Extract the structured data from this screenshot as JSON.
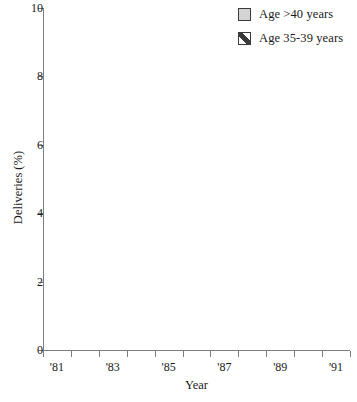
{
  "chart_data": {
    "type": "bar",
    "stacked": true,
    "title": "",
    "xlabel": "Year",
    "ylabel": "Deliveries (%)",
    "ylim": [
      0,
      10
    ],
    "ytick_values": [
      0,
      2,
      4,
      6,
      8,
      10
    ],
    "ytick_labels": [
      "0",
      "2",
      "4",
      "6",
      "8",
      "10"
    ],
    "grid": false,
    "legend_position": "top-right",
    "categories": [
      "'81",
      "'82",
      "'83",
      "'84",
      "'85",
      "'86",
      "'87",
      "'88",
      "'89",
      "'90",
      "'91"
    ],
    "xtick_labels": [
      "'81",
      "",
      "'83",
      "",
      "'85",
      "",
      "'87",
      "",
      "'89",
      "",
      "'91"
    ],
    "series": [
      {
        "name": "Age 35-39 years",
        "fill": "diagonal-hatch",
        "values": [
          4.4,
          5.1,
          5.4,
          5.4,
          5.5,
          5.5,
          5.4,
          5.5,
          5.9,
          6.4,
          6.4
        ]
      },
      {
        "name": "Age >40 years",
        "fill": "solid-gray",
        "values": [
          0.8,
          0.65,
          0.75,
          0.7,
          0.75,
          0.9,
          0.75,
          0.85,
          0.9,
          1.0,
          1.0
        ]
      }
    ],
    "totals": [
      5.2,
      5.75,
      6.15,
      6.1,
      6.25,
      6.4,
      6.15,
      6.35,
      6.8,
      7.4,
      7.4
    ]
  },
  "legend": {
    "items": [
      {
        "label": "Age >40 years",
        "swatch": "solid-gray"
      },
      {
        "label": "Age 35-39 years",
        "swatch": "diagonal-hatch"
      }
    ]
  },
  "axes": {
    "y_title": "Deliveries (%)",
    "x_title": "Year"
  }
}
